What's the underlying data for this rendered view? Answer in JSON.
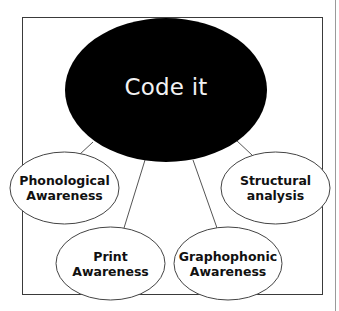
{
  "diagram": {
    "type": "concept-map",
    "center": {
      "label": "Code it",
      "fill": "#000000",
      "text_color": "#f2f2f2"
    },
    "nodes": [
      {
        "id": "phonological",
        "line1": "Phonological",
        "line2": "Awareness"
      },
      {
        "id": "print",
        "line1": "Print",
        "line2": "Awareness"
      },
      {
        "id": "graphophonic",
        "line1": "Graphophonic",
        "line2": "Awareness"
      },
      {
        "id": "structural",
        "line1": "Structural",
        "line2": "analysis"
      }
    ],
    "node_fill": "#ffffff",
    "node_stroke": "#444444",
    "frame_stroke": "#3a3a3a"
  }
}
